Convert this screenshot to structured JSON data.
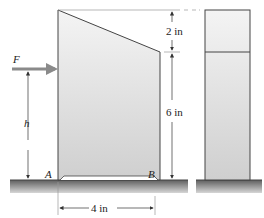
{
  "diagram": {
    "labels": {
      "force": "F",
      "height": "h",
      "point_a": "A",
      "point_b": "B",
      "dim_top": "2 in",
      "dim_side": "6 in",
      "dim_base": "4 in"
    },
    "colors": {
      "block_fill_light": "#f2f2f2",
      "block_fill_dark": "#c8c8c8",
      "arrow": "#8a8a8a",
      "ground_dark": "#6e6e6e",
      "ground_light": "#c9c9c9",
      "line": "#333333"
    }
  }
}
